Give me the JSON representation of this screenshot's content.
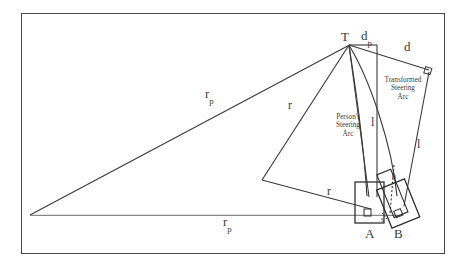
{
  "figure": {
    "type": "geometric-diagram",
    "background_color": "#ffffff",
    "line_color": "#3a3a3a",
    "frame_color": "#4a4a4a"
  },
  "labels": {
    "apex_point": "T",
    "vehicle_a": "A",
    "vehicle_b": "B",
    "radius_person_upper": "r",
    "radius_person_upper_sub": "p",
    "radius_person_lower": "r",
    "radius_person_lower_sub": "p",
    "radius_upper": "r",
    "radius_lower": "r",
    "distance_person": "d",
    "distance_person_sub": "p",
    "distance_transformed": "d",
    "length_left": "l",
    "length_right": "l",
    "offset": "s",
    "angle_theta": "θ",
    "person_arc_line1": "Person's",
    "person_arc_line2": "Steering",
    "person_arc_line3": "Arc",
    "transformed_arc_line1": "Transformed",
    "transformed_arc_line2": "Steering",
    "transformed_arc_line3": "Arc"
  },
  "geometry": {
    "apex_T": [
      349,
      44
    ],
    "triangle_left_vertex": [
      30,
      215
    ],
    "vehicle_a_center": [
      362,
      205
    ],
    "vehicle_b_center": [
      395,
      203
    ],
    "right_angle_marker_top_right": [
      428,
      72
    ],
    "quad_left_vertex": [
      262,
      180
    ]
  }
}
